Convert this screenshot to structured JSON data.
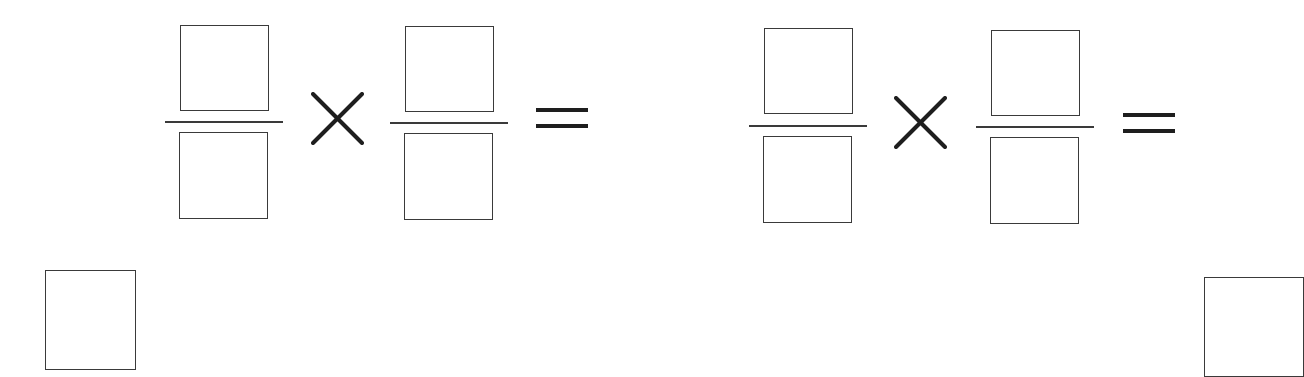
{
  "worksheet": {
    "problems": [
      {
        "operator": "multiply",
        "operator_icon": "times-icon",
        "equals_icon": "equals-icon",
        "fraction_1": {
          "numerator": "",
          "denominator": ""
        },
        "fraction_2": {
          "numerator": "",
          "denominator": ""
        },
        "answer": ""
      },
      {
        "operator": "multiply",
        "operator_icon": "times-icon",
        "equals_icon": "equals-icon",
        "fraction_1": {
          "numerator": "",
          "denominator": ""
        },
        "fraction_2": {
          "numerator": "",
          "denominator": ""
        },
        "answer": ""
      }
    ],
    "answer_boxes": [
      {
        "value": ""
      },
      {
        "value": ""
      }
    ],
    "colors": {
      "ink": "#3a3a3a",
      "operator_ink": "#1e1e1e",
      "background": "#ffffff"
    }
  }
}
